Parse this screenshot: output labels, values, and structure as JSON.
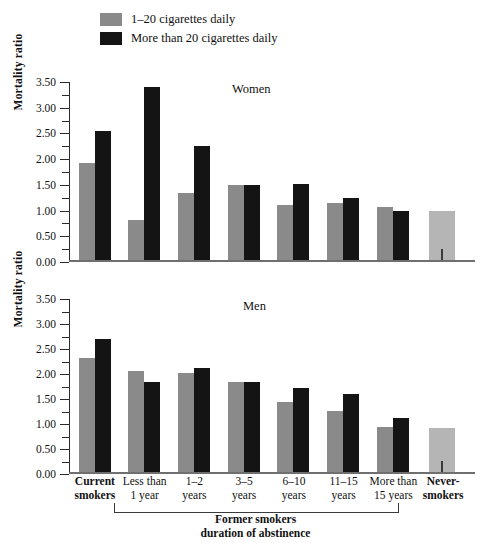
{
  "legend": {
    "items": [
      {
        "label": "1–20 cigarettes daily",
        "color": "#8a8a8a",
        "icon": "legend-swatch-gray"
      },
      {
        "label": "More than 20 cigarettes daily",
        "color": "#141414",
        "icon": "legend-swatch-black"
      }
    ]
  },
  "colors": {
    "light_smokers": "#8a8a8a",
    "heavy_smokers": "#141414",
    "never_smokers": "#b5b5b5",
    "axis": "#2b2b2b",
    "baseline": "#6f6f6f"
  },
  "axis": {
    "ylabel": "Mortality ratio",
    "yticks": [
      "0.00",
      "0.50",
      "1.00",
      "1.50",
      "2.00",
      "2.50",
      "3.00",
      "3.50"
    ],
    "ymin": 0,
    "ymax": 3.5
  },
  "categories": [
    "Current smokers",
    "Less than 1 year",
    "1–2 years",
    "3–5 years",
    "6–10 years",
    "11–15 years",
    "More than 15 years",
    "Never-smokers"
  ],
  "xlabels": [
    {
      "line1": "Current",
      "line2": "smokers",
      "bold": true
    },
    {
      "line1": "Less than",
      "line2": "1 year",
      "bold": false
    },
    {
      "line1": "1–2",
      "line2": "years",
      "bold": false
    },
    {
      "line1": "3–5",
      "line2": "years",
      "bold": false
    },
    {
      "line1": "6–10",
      "line2": "years",
      "bold": false
    },
    {
      "line1": "11–15",
      "line2": "years",
      "bold": false
    },
    {
      "line1": "More than",
      "line2": "15 years",
      "bold": false
    },
    {
      "line1": "Never-",
      "line2": "smokers",
      "bold": true
    }
  ],
  "bracket": {
    "caption_line1": "Former smokers",
    "caption_line2": "duration of abstinence"
  },
  "panels": [
    {
      "id": "women",
      "title": "Women"
    },
    {
      "id": "men",
      "title": "Men"
    }
  ],
  "chart_data": [
    {
      "type": "bar",
      "title": "Women",
      "xlabel": "Former smokers duration of abstinence",
      "ylabel": "Mortality ratio",
      "ylim": [
        0,
        3.5
      ],
      "ytick_step": 0.5,
      "grid": false,
      "legend_position": "top-left",
      "categories": [
        "Current smokers",
        "Less than 1 year",
        "1–2 years",
        "3–5 years",
        "6–10 years",
        "11–15 years",
        "More than 15 years",
        "Never-smokers"
      ],
      "series": [
        {
          "name": "1–20 cigarettes daily",
          "color": "#8a8a8a",
          "values": [
            1.93,
            0.82,
            1.35,
            1.5,
            1.1,
            1.15,
            1.07,
            null
          ]
        },
        {
          "name": "More than 20 cigarettes daily",
          "color": "#141414",
          "values": [
            2.55,
            3.4,
            2.25,
            1.5,
            1.52,
            1.25,
            1.0,
            null
          ]
        },
        {
          "name": "Never-smokers reference",
          "color": "#b5b5b5",
          "values": [
            null,
            null,
            null,
            null,
            null,
            null,
            null,
            1.0
          ]
        }
      ]
    },
    {
      "type": "bar",
      "title": "Men",
      "xlabel": "Former smokers duration of abstinence",
      "ylabel": "Mortality ratio",
      "ylim": [
        0,
        3.5
      ],
      "ytick_step": 0.5,
      "grid": false,
      "legend_position": "top-left",
      "categories": [
        "Current smokers",
        "Less than 1 year",
        "1–2 years",
        "3–5 years",
        "6–10 years",
        "11–15 years",
        "More than 15 years",
        "Never-smokers"
      ],
      "series": [
        {
          "name": "1–20 cigarettes daily",
          "color": "#8a8a8a",
          "values": [
            2.33,
            2.07,
            2.03,
            1.85,
            1.45,
            1.27,
            0.95,
            null
          ]
        },
        {
          "name": "More than 20 cigarettes daily",
          "color": "#141414",
          "values": [
            2.7,
            1.85,
            2.12,
            1.85,
            1.73,
            1.6,
            1.13,
            null
          ]
        },
        {
          "name": "Never-smokers reference",
          "color": "#b5b5b5",
          "values": [
            null,
            null,
            null,
            null,
            null,
            null,
            null,
            0.92
          ]
        }
      ]
    }
  ]
}
